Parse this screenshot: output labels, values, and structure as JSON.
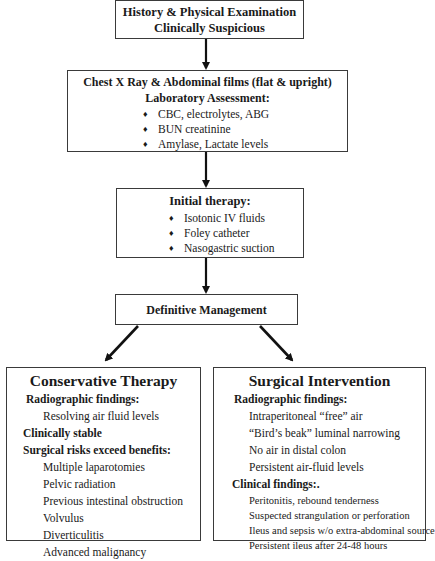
{
  "box1": {
    "line1": "History & Physical Examination",
    "line2": "Clinically Suspicious"
  },
  "box2": {
    "title": "Chest X Ray & Abdominal films (flat & upright)",
    "subtitle": "Laboratory Assessment:",
    "items": [
      "CBC, electrolytes, ABG",
      "BUN creatinine",
      "Amylase, Lactate levels"
    ]
  },
  "box3": {
    "title": "Initial therapy:",
    "items": [
      "Isotonic IV fluids",
      "Foley catheter",
      "Nasogastric suction"
    ]
  },
  "box4": {
    "title": "Definitive Management"
  },
  "conservative": {
    "title": "Conservative Therapy",
    "radiographic_heading": "Radiographic findings:",
    "radiographic_items": [
      "Resolving air fluid levels"
    ],
    "clinically_stable": "Clinically stable",
    "risks_heading": "Surgical risks exceed benefits:",
    "risks_items": [
      "Multiple laparotomies",
      "Pelvic radiation",
      "Previous intestinal obstruction",
      "Volvulus",
      "Diverticulitis",
      "Advanced malignancy"
    ]
  },
  "surgical": {
    "title": "Surgical Intervention",
    "radiographic_heading": "Radiographic findings:",
    "radiographic_items": [
      "Intraperitoneal “free” air",
      "“Bird’s beak” luminal narrowing",
      "No air in distal colon",
      "Persistent air-fluid levels"
    ],
    "clinical_heading": "Clinical findings:.",
    "clinical_items": [
      "Peritonitis, rebound tenderness",
      "Suspected strangulation or perforation",
      "Ileus and sepsis w/o extra-abdominal source",
      "Persistent ileus after 24-48 hours"
    ]
  }
}
